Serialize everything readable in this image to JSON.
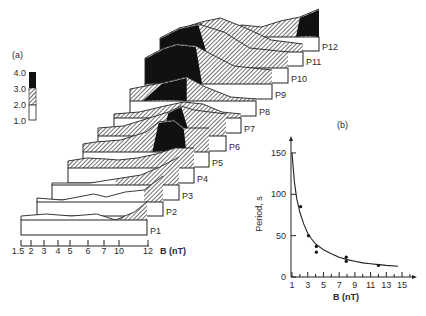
{
  "chart_data": [
    {
      "type": "heatmap",
      "panel_label": "(a)",
      "title": "Stacked spectral panels P1–P12 vs magnetic field B",
      "xlabel": "B (nT)",
      "x_ticks": [
        "1.5",
        "2",
        "3",
        "4",
        "5",
        "6",
        "7",
        "10",
        "12"
      ],
      "colorbar": {
        "ticks": [
          "4.0",
          "3.0",
          "2.0",
          "1.0"
        ],
        "levels": [
          {
            "range": "3.0-4.0",
            "fill": "black"
          },
          {
            "range": "2.0-3.0",
            "fill": "hatched"
          },
          {
            "range": "1.0-2.0",
            "fill": "white"
          }
        ]
      },
      "panels": [
        "P1",
        "P2",
        "P3",
        "P4",
        "P5",
        "P6",
        "P7",
        "P8",
        "P9",
        "P10",
        "P11",
        "P12"
      ]
    },
    {
      "type": "scatter",
      "panel_label": "(b)",
      "xlabel": "B (nT)",
      "ylabel": "Period, s",
      "x_ticks": [
        1,
        3,
        5,
        7,
        9,
        11,
        13,
        15
      ],
      "y_ticks": [
        0,
        50,
        100,
        150
      ],
      "xlim": [
        0.5,
        16
      ],
      "ylim": [
        0,
        160
      ],
      "series": [
        {
          "name": "observed",
          "points": [
            [
              2.1,
              85
            ],
            [
              3.1,
              50
            ],
            [
              4.1,
              37
            ],
            [
              4.1,
              30
            ],
            [
              7.9,
              24
            ],
            [
              7.9,
              19
            ],
            [
              12,
              14
            ]
          ]
        },
        {
          "name": "fit",
          "style": "line",
          "points": [
            [
              1,
              150
            ],
            [
              1.3,
              115
            ],
            [
              1.6,
              95
            ],
            [
              2,
              78
            ],
            [
              2.5,
              64
            ],
            [
              3,
              53
            ],
            [
              3.5,
              46
            ],
            [
              4,
              40
            ],
            [
              5,
              33
            ],
            [
              6,
              28
            ],
            [
              7,
              24
            ],
            [
              8,
              21
            ],
            [
              9,
              19
            ],
            [
              10,
              17
            ],
            [
              11,
              16
            ],
            [
              12,
              15
            ],
            [
              13,
              14
            ],
            [
              14.5,
              13
            ]
          ]
        }
      ]
    }
  ]
}
